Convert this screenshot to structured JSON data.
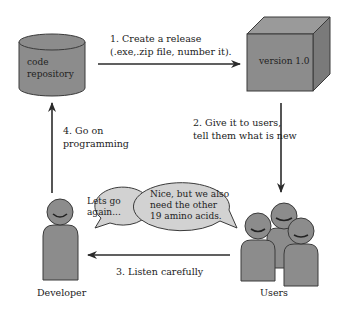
{
  "nodes": {
    "repository": {
      "line1": "code",
      "line2": "repository"
    },
    "release": {
      "label": "version 1.0"
    },
    "developer": {
      "label": "Developer"
    },
    "users": {
      "label": "Users"
    }
  },
  "steps": [
    {
      "line1": "1. Create a release",
      "line2": "(.exe,.zip file, number it)."
    },
    {
      "line1": "2. Give it to users,",
      "line2": "tell them what is new"
    },
    {
      "line1": "3. Listen carefully"
    },
    {
      "line1": "4. Go on",
      "line2": "programming"
    }
  ],
  "bubbles": {
    "developer": {
      "line1": "Lets go",
      "line2": "again..."
    },
    "users": {
      "line1": "Nice, but we also",
      "line2": "need the other",
      "line3": "19 amino acids."
    }
  },
  "colors": {
    "shape_fill": "#8c8c8c",
    "shape_stroke": "#3a3a3a",
    "bubble_fill": "#d2d2d2",
    "arrow": "#2b2b2b"
  }
}
